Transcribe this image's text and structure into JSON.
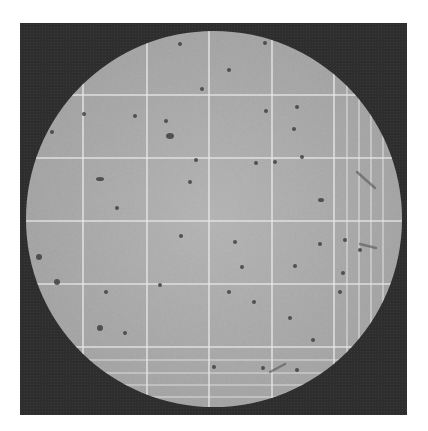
{
  "image": {
    "subject": "counting chamber grid micrograph",
    "style": "grayscale",
    "colors": {
      "background": "#ffffff",
      "frame": "#2e2e2e",
      "field": "#a9a9a9",
      "grid_line": "#e8e8e8",
      "particle": "#3a3a3a"
    },
    "field_circle": {
      "cx": 214,
      "cy": 219,
      "r": 188
    },
    "grid": {
      "vertical_lines_x": [
        83,
        147,
        209,
        272,
        334,
        347,
        359,
        371,
        383
      ],
      "horizontal_lines_y": [
        95,
        158,
        221,
        284,
        347,
        360,
        373,
        385,
        397
      ]
    },
    "particles": [
      {
        "x": 170,
        "y": 136,
        "rx": 4,
        "ry": 3
      },
      {
        "x": 100,
        "y": 179,
        "rx": 4,
        "ry": 2
      },
      {
        "x": 135,
        "y": 116,
        "rx": 2,
        "ry": 2
      },
      {
        "x": 166,
        "y": 121,
        "rx": 2,
        "ry": 2
      },
      {
        "x": 202,
        "y": 89,
        "rx": 2,
        "ry": 2
      },
      {
        "x": 229,
        "y": 70,
        "rx": 2,
        "ry": 2
      },
      {
        "x": 52,
        "y": 132,
        "rx": 2,
        "ry": 2
      },
      {
        "x": 84,
        "y": 114,
        "rx": 2,
        "ry": 2
      },
      {
        "x": 196,
        "y": 160,
        "rx": 2,
        "ry": 2
      },
      {
        "x": 190,
        "y": 182,
        "rx": 2,
        "ry": 2
      },
      {
        "x": 117,
        "y": 208,
        "rx": 2,
        "ry": 2
      },
      {
        "x": 180,
        "y": 44,
        "rx": 2,
        "ry": 2
      },
      {
        "x": 265,
        "y": 43,
        "rx": 2,
        "ry": 2
      },
      {
        "x": 297,
        "y": 107,
        "rx": 2,
        "ry": 2
      },
      {
        "x": 266,
        "y": 111,
        "rx": 2,
        "ry": 2
      },
      {
        "x": 294,
        "y": 129,
        "rx": 2,
        "ry": 2
      },
      {
        "x": 235,
        "y": 242,
        "rx": 2,
        "ry": 2
      },
      {
        "x": 321,
        "y": 200,
        "rx": 3,
        "ry": 2
      },
      {
        "x": 256,
        "y": 163,
        "rx": 2,
        "ry": 2
      },
      {
        "x": 275,
        "y": 162,
        "rx": 2,
        "ry": 2
      },
      {
        "x": 302,
        "y": 157,
        "rx": 2,
        "ry": 2
      },
      {
        "x": 39,
        "y": 257,
        "rx": 3,
        "ry": 3
      },
      {
        "x": 57,
        "y": 282,
        "rx": 3,
        "ry": 3
      },
      {
        "x": 100,
        "y": 328,
        "rx": 3,
        "ry": 3
      },
      {
        "x": 106,
        "y": 292,
        "rx": 2,
        "ry": 2
      },
      {
        "x": 125,
        "y": 333,
        "rx": 2,
        "ry": 2
      },
      {
        "x": 160,
        "y": 285,
        "rx": 2,
        "ry": 2
      },
      {
        "x": 181,
        "y": 236,
        "rx": 2,
        "ry": 2
      },
      {
        "x": 242,
        "y": 267,
        "rx": 2,
        "ry": 2
      },
      {
        "x": 295,
        "y": 266,
        "rx": 2,
        "ry": 2
      },
      {
        "x": 229,
        "y": 292,
        "rx": 2,
        "ry": 2
      },
      {
        "x": 290,
        "y": 318,
        "rx": 2,
        "ry": 2
      },
      {
        "x": 254,
        "y": 302,
        "rx": 2,
        "ry": 2
      },
      {
        "x": 313,
        "y": 340,
        "rx": 2,
        "ry": 2
      },
      {
        "x": 343,
        "y": 273,
        "rx": 2,
        "ry": 2
      },
      {
        "x": 360,
        "y": 250,
        "rx": 2,
        "ry": 2
      },
      {
        "x": 345,
        "y": 240,
        "rx": 2,
        "ry": 2
      },
      {
        "x": 320,
        "y": 244,
        "rx": 2,
        "ry": 2
      },
      {
        "x": 214,
        "y": 367,
        "rx": 2,
        "ry": 2
      },
      {
        "x": 263,
        "y": 368,
        "rx": 2,
        "ry": 2
      },
      {
        "x": 297,
        "y": 370,
        "rx": 2,
        "ry": 2
      },
      {
        "x": 340,
        "y": 292,
        "rx": 2,
        "ry": 2
      }
    ],
    "streaks": [
      {
        "x1": 357,
        "y1": 172,
        "x2": 375,
        "y2": 188
      },
      {
        "x1": 360,
        "y1": 244,
        "x2": 376,
        "y2": 248
      },
      {
        "x1": 270,
        "y1": 372,
        "x2": 285,
        "y2": 364
      }
    ]
  }
}
